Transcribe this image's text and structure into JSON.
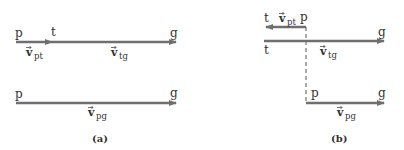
{
  "colors": {
    "arrow": "#6f6f6f",
    "text": "#333333",
    "dashed": "#555555"
  },
  "panel_a": {
    "caption": "(a)",
    "top": {
      "label_start": "p",
      "label_mid": "t",
      "label_end": "g",
      "vec_pt": {
        "v": "v",
        "sub": "pt"
      },
      "vec_tg": {
        "v": "v",
        "sub": "tg"
      }
    },
    "bottom": {
      "label_start": "p",
      "label_end": "g",
      "vec_pg": {
        "v": "v",
        "sub": "pg"
      }
    }
  },
  "panel_b": {
    "caption": "(b)",
    "top": {
      "label_t_arrow": "t",
      "label_p": "p",
      "vec_pt": {
        "v": "v",
        "sub": "pt"
      }
    },
    "middle": {
      "label_start": "t",
      "label_end": "g",
      "vec_tg": {
        "v": "v",
        "sub": "tg"
      }
    },
    "bottom": {
      "label_start": "p",
      "label_end": "g",
      "vec_pg": {
        "v": "v",
        "sub": "pg"
      }
    }
  }
}
